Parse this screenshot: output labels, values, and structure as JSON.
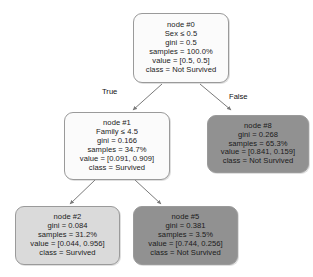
{
  "diagram": {
    "type": "decision-tree",
    "title": "",
    "edge_labels": {
      "true": "True",
      "false": "False"
    },
    "nodes": [
      {
        "id": "node0",
        "name": "node #0",
        "condition": "Sex ≤ 0.5",
        "gini": "gini = 0.5",
        "samples": "samples = 100.0%",
        "value": "value = [0.5, 0.5]",
        "class": "class = Not Survived",
        "fill": "#fbfbfb",
        "fill_style": "fill-white"
      },
      {
        "id": "node1",
        "name": "node #1",
        "condition": "Family ≤ 4.5",
        "gini": "gini = 0.166",
        "samples": "samples = 34.7%",
        "value": "value = [0.091, 0.909]",
        "class": "class = Survived",
        "fill": "#fbfbfb",
        "fill_style": "fill-white"
      },
      {
        "id": "node8",
        "name": "node #8",
        "condition": "",
        "gini": "gini = 0.268",
        "samples": "samples = 65.3%",
        "value": "value = [0.841, 0.159]",
        "class": "class = Not Survived",
        "fill": "#919191",
        "fill_style": "fill-mid"
      },
      {
        "id": "node2",
        "name": "node #2",
        "condition": "",
        "gini": "gini = 0.084",
        "samples": "samples = 31.2%",
        "value": "value = [0.044, 0.956]",
        "class": "class = Survived",
        "fill": "#dadada",
        "fill_style": "fill-light"
      },
      {
        "id": "node5",
        "name": "node #5",
        "condition": "",
        "gini": "gini = 0.381",
        "samples": "samples = 3.5%",
        "value": "value = [0.744, 0.256]",
        "class": "class = Not Survived",
        "fill": "#919191",
        "fill_style": "fill-mid"
      }
    ]
  }
}
